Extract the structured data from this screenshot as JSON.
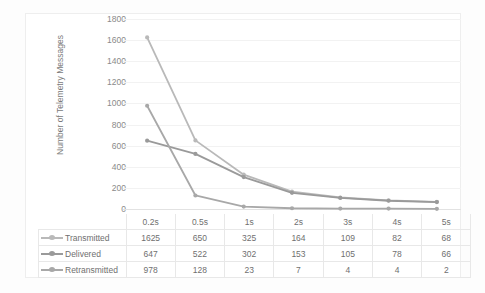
{
  "chart_data": {
    "type": "line",
    "title": "",
    "xlabel": "",
    "ylabel": "Number of Telemetry Messages",
    "categories": [
      "0.2s",
      "0.5s",
      "1s",
      "2s",
      "3s",
      "4s",
      "5s"
    ],
    "ylim": [
      0,
      1800
    ],
    "y_ticks": [
      0,
      200,
      400,
      600,
      800,
      1000,
      1200,
      1400,
      1600,
      1800
    ],
    "y_tick_labels": [
      "0",
      "200",
      "400",
      "600",
      "800",
      "1000",
      "1200",
      "1400",
      "1600",
      "1800"
    ],
    "grid": true,
    "legend_position": "data-table-left",
    "has_data_table": true,
    "markers": true,
    "series": [
      {
        "name": "Transmitted",
        "values": [
          1625,
          650,
          325,
          164,
          109,
          82,
          68
        ],
        "color": "#b9b9b9"
      },
      {
        "name": "Delivered",
        "values": [
          647,
          522,
          302,
          153,
          105,
          78,
          66
        ],
        "color": "#9a9a9a"
      },
      {
        "name": "Retransmitted",
        "values": [
          978,
          128,
          23,
          7,
          4,
          4,
          2
        ],
        "color": "#a8a8a8"
      }
    ]
  },
  "axis": {
    "y_title": "Number of Telemetry Messages"
  },
  "table": {
    "category_labels": [
      "0.2s",
      "0.5s",
      "1s",
      "2s",
      "3s",
      "4s",
      "5s"
    ],
    "rows": [
      {
        "label": "Transmitted",
        "color": "#b9b9b9",
        "cells": [
          "1625",
          "650",
          "325",
          "164",
          "109",
          "82",
          "68"
        ]
      },
      {
        "label": "Delivered",
        "color": "#9a9a9a",
        "cells": [
          "647",
          "522",
          "302",
          "153",
          "105",
          "78",
          "66"
        ]
      },
      {
        "label": "Retransmitted",
        "color": "#a8a8a8",
        "cells": [
          "978",
          "128",
          "23",
          "7",
          "4",
          "4",
          "2"
        ]
      }
    ]
  },
  "colors": {
    "gridline": "#f2f2f2",
    "axis_text": "#8a8a8a",
    "table_border": "#e8e8e8",
    "frame_border": "#eeeeee"
  }
}
